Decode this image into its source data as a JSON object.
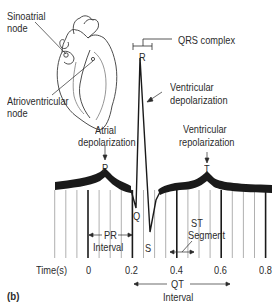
{
  "figure": {
    "panel_label": "(b)",
    "heart": {
      "labels": {
        "sinoatrial_line1": "Sinoatrial",
        "sinoatrial_line2": "node",
        "atrioventricular_line1": "Atrioventricular",
        "atrioventricular_line2": "node"
      }
    },
    "waves": {
      "P": "P",
      "Q": "Q",
      "R": "R",
      "S": "S",
      "T": "T"
    },
    "annotations": {
      "qrs_complex": "QRS complex",
      "ventricular_depol_line1": "Ventricular",
      "ventricular_depol_line2": "depolarization",
      "atrial_depol_line1": "Atrial",
      "atrial_depol_line2": "depolarization",
      "ventricular_repol_line1": "Ventricular",
      "ventricular_repol_line2": "repolarization",
      "pr_line1": "PR",
      "pr_line2": "Interval",
      "st_line1": "ST",
      "st_line2": "Segment",
      "qt_line1": "QT",
      "qt_line2": "Interval"
    },
    "time_axis": {
      "label": "Time(s)",
      "ticks": [
        "0",
        "0.2",
        "0.4",
        "0.6",
        "0.8"
      ],
      "range": [
        0,
        0.8
      ],
      "minor_step": 0.05
    },
    "colors": {
      "ink": "#1a1a1a",
      "grid": "#7a7a7a",
      "text": "#2b2b2b"
    }
  }
}
